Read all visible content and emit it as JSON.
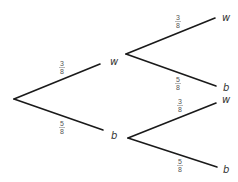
{
  "diagram": {
    "type": "probability-tree",
    "root": {
      "branches": [
        {
          "probability": {
            "numerator": "3",
            "denominator": "8"
          },
          "outcome": "w",
          "branches": [
            {
              "probability": {
                "numerator": "3",
                "denominator": "8"
              },
              "outcome": "w"
            },
            {
              "probability": {
                "numerator": "5",
                "denominator": "8"
              },
              "outcome": "b"
            }
          ]
        },
        {
          "probability": {
            "numerator": "5",
            "denominator": "8"
          },
          "outcome": "b",
          "branches": [
            {
              "probability": {
                "numerator": "3",
                "denominator": "8"
              },
              "outcome": "w"
            },
            {
              "probability": {
                "numerator": "5",
                "denominator": "8"
              },
              "outcome": "b"
            }
          ]
        }
      ]
    }
  }
}
